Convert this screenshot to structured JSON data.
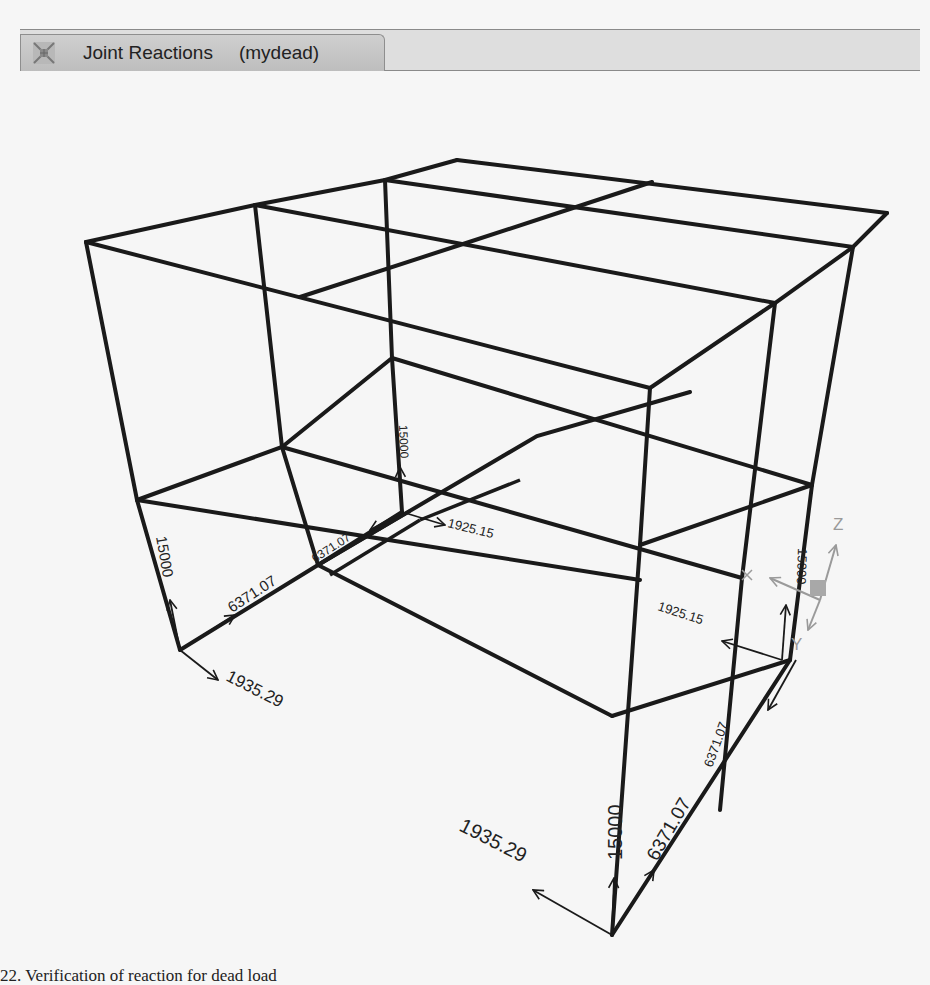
{
  "window": {
    "tab": {
      "icon": "frame-structure-icon",
      "title": "Joint Reactions",
      "load_case": "(mydead)"
    }
  },
  "viewport": {
    "view": "3D",
    "axes": {
      "z_label": "Z",
      "y_label": "Y",
      "x_label": "X"
    },
    "colors": {
      "frame": "#1a1a1a",
      "reaction_arrow": "#1a1a1a",
      "axis_triad": "#9a9a9a"
    },
    "reactions": [
      {
        "joint": "front-left",
        "fz": "15000",
        "fy": "6371.07",
        "fx": "1935.29"
      },
      {
        "joint": "rear-left",
        "fz": "15000",
        "fy": "6371.07",
        "fx": "1925.15"
      },
      {
        "joint": "rear-right",
        "fz": "15000",
        "fy": "6371.07",
        "fx": "1925.15"
      },
      {
        "joint": "front-right",
        "fz": "15000",
        "fy": "6371.07",
        "fx": "1935.29"
      }
    ]
  },
  "caption": "22. Verification of reaction for dead load"
}
